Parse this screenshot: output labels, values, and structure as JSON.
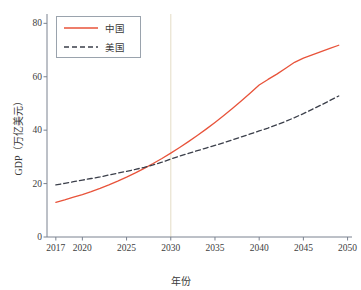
{
  "chart_data": {
    "type": "line",
    "title": "",
    "xlabel": "年份",
    "ylabel": "GDP（万亿美元）",
    "xlim": [
      2016,
      2050.5
    ],
    "ylim": [
      0,
      82
    ],
    "grid": false,
    "legend_position": "upper left",
    "x_ticks": [
      "2017",
      "2020",
      "2025",
      "2030",
      "2035",
      "2040",
      "2045",
      "2050"
    ],
    "x_tick_values": [
      2017,
      2020,
      2025,
      2030,
      2035,
      2040,
      2045,
      2050
    ],
    "y_ticks": [
      "0",
      "20",
      "40",
      "60",
      "80"
    ],
    "y_tick_values": [
      0,
      20,
      40,
      60,
      80
    ],
    "annotations": [
      {
        "type": "vline",
        "label": "2030",
        "x": 2030,
        "color": "#e8e2cf"
      }
    ],
    "x": [
      2017,
      2018,
      2019,
      2020,
      2021,
      2022,
      2023,
      2024,
      2025,
      2026,
      2027,
      2028,
      2029,
      2030,
      2031,
      2032,
      2033,
      2034,
      2035,
      2036,
      2037,
      2038,
      2039,
      2040,
      2041,
      2042,
      2043,
      2044,
      2045,
      2046,
      2047,
      2048,
      2049
    ],
    "series": [
      {
        "name": "中国",
        "color": "#e8533a",
        "linestyle": "solid",
        "values": [
          13.0,
          13.9,
          14.9,
          15.9,
          17.0,
          18.2,
          19.5,
          20.9,
          22.4,
          24.0,
          25.7,
          27.5,
          29.4,
          31.4,
          33.5,
          35.7,
          38.0,
          40.4,
          42.9,
          45.5,
          48.2,
          51.0,
          53.9,
          56.9,
          59.0,
          61.0,
          63.2,
          65.4,
          67.0,
          68.2,
          69.4,
          70.6,
          71.8
        ]
      },
      {
        "name": "美国",
        "color": "#3b3f4a",
        "linestyle": "dashed",
        "values": [
          19.5,
          20.1,
          20.7,
          21.3,
          21.9,
          22.5,
          23.2,
          23.9,
          24.6,
          25.3,
          26.1,
          27.0,
          28.0,
          29.2,
          30.3,
          31.3,
          32.3,
          33.3,
          34.3,
          35.3,
          36.4,
          37.5,
          38.6,
          39.7,
          40.8,
          42.0,
          43.3,
          44.7,
          46.2,
          47.8,
          49.4,
          51.1,
          52.8
        ]
      }
    ]
  }
}
